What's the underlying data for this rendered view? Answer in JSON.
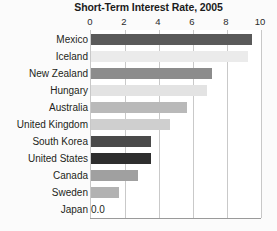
{
  "chart_data": {
    "type": "bar",
    "orientation": "horizontal",
    "title": "Short-Term Interest Rate, 2005",
    "xlabel": "",
    "ylabel": "",
    "xlim": [
      0,
      10
    ],
    "xticks": [
      0,
      2,
      4,
      6,
      8,
      10
    ],
    "xtick_labels": [
      "0",
      "2",
      "4",
      "6",
      "8",
      "10"
    ],
    "grid": true,
    "legend": "none",
    "categories": [
      "Mexico",
      "Iceland",
      "New Zealand",
      "Hungary",
      "Australia",
      "United Kingdom",
      "South Korea",
      "United States",
      "Canada",
      "Sweden",
      "Japan"
    ],
    "values": [
      9.5,
      9.3,
      7.2,
      6.9,
      5.7,
      4.7,
      3.6,
      3.6,
      2.8,
      1.7,
      0.0
    ],
    "bar_colors": [
      "#5a5a5a",
      "#ebebeb",
      "#8c8c8c",
      "#e3e3e3",
      "#b9b9b9",
      "#cfcfcf",
      "#4a4a4a",
      "#2e2e2e",
      "#a0a0a0",
      "#b2b2b2",
      "#ffffff"
    ],
    "annotations": [
      {
        "category": "Japan",
        "text": "0.0"
      }
    ]
  },
  "axis": {
    "gridline_color": "#c9c9c9",
    "baseline_color": "#9a9a9a"
  },
  "page_background": "#fbfbfb"
}
